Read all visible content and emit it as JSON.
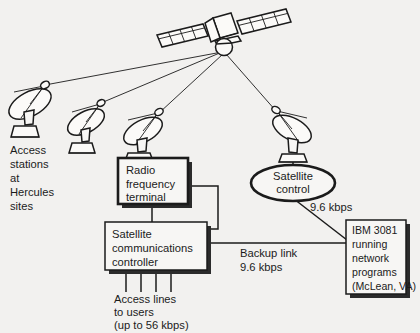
{
  "diagram": {
    "background_color": "#f2f1ef",
    "ink_color": "#1b1b1b",
    "labels": {
      "access_stations": "Access\nstations\nat\nHercules\nsites",
      "access_stations_lines": [
        "Access",
        "stations",
        "at",
        "Hercules",
        "sites"
      ],
      "radio_frequency_terminal": "Radio\nfrequency\nterminal",
      "radio_frequency_terminal_lines": [
        "Radio",
        "frequency",
        "terminal"
      ],
      "satellite_communications_controller": "Satellite\ncommunications\ncontroller",
      "satellite_communications_controller_lines": [
        "Satellite",
        "communications",
        "controller"
      ],
      "satellite_control": "Satellite\ncontrol",
      "satellite_control_lines": [
        "Satellite",
        "control"
      ],
      "ibm_host": "IBM 3081\nrunning\nnetwork\nprograms\n(McLean, VA)",
      "ibm_host_lines": [
        "IBM 3081",
        "running",
        "network",
        "programs",
        "(McLean, VA)"
      ],
      "access_lines_to_users": "Access lines\nto users\n(up to 56 kbps)",
      "access_lines_to_users_lines": [
        "Access lines",
        "to users",
        "(up to 56 kbps)"
      ],
      "control_link_rate": "9.6 kbps",
      "backup_link": "Backup link\n9.6 kbps",
      "backup_link_lines": [
        "Backup link",
        "9.6 kbps"
      ]
    },
    "nodes": {
      "satellite": "satellite",
      "ground_station_1": "earth-station-dish-1",
      "ground_station_2": "earth-station-dish-2",
      "ground_station_3": "earth-station-dish-3",
      "ground_station_4": "earth-station-dish-4"
    },
    "counts": {
      "ground_stations": 4,
      "access_lines": 4,
      "solar_panel_cells_per_wing": 8
    }
  }
}
